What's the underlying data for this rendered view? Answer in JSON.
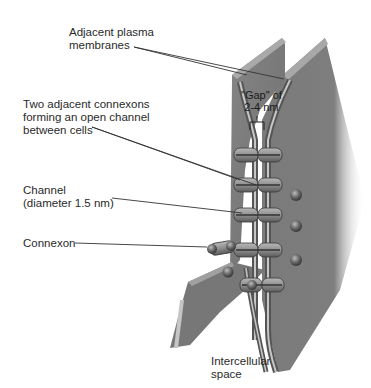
{
  "diagram": {
    "colors": {
      "membrane_fill": "#7a7a7a",
      "membrane_back": "#6a6a6a",
      "membrane_stripe_light": "#c8c8c8",
      "connexon_fill": "#9a9a9a",
      "leader_line": "#333333",
      "text": "#2a2a2a"
    },
    "labels": {
      "plasma_membranes": "Adjacent plasma\nmembranes",
      "connexons_channel": "Two adjacent connexons\nforming an open channel\nbetween cells",
      "channel": "Channel\n(diameter 1.5 nm)",
      "connexon": "Connexon",
      "gap": "\"Gap\" of\n2-4 nm",
      "intercellular_space": "Intercellular\nspace"
    },
    "connexon_pairs_count": 5
  }
}
